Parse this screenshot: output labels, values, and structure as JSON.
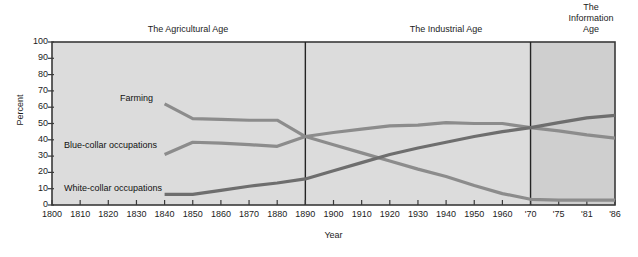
{
  "chart_data": {
    "type": "line",
    "title": "",
    "xlabel": "Year",
    "ylabel": "Percent",
    "ylim": [
      0,
      100
    ],
    "ytick_values": [
      0,
      10,
      20,
      30,
      40,
      50,
      60,
      70,
      80,
      90,
      100
    ],
    "xtick_labels": [
      "1800",
      "1810",
      "1820",
      "1830",
      "1840",
      "1850",
      "1860",
      "1870",
      "1880",
      "1890",
      "1900",
      "1910",
      "1920",
      "1930",
      "1940",
      "1950",
      "1960",
      "'70",
      "'75",
      "'81",
      "'86"
    ],
    "xtick_years": [
      1800,
      1810,
      1820,
      1830,
      1840,
      1850,
      1860,
      1870,
      1880,
      1890,
      1900,
      1910,
      1920,
      1930,
      1940,
      1950,
      1960,
      1970,
      1975,
      1981,
      1986
    ],
    "grid": false,
    "legend_position": "inline-annotations",
    "series": [
      {
        "name": "Farming",
        "color": "#8c8c8c",
        "x": [
          1840,
          1850,
          1860,
          1870,
          1880,
          1890,
          1900,
          1910,
          1920,
          1930,
          1940,
          1950,
          1960,
          1970,
          1975,
          1981,
          1986
        ],
        "values": [
          62,
          53,
          52.5,
          52,
          52,
          42,
          37,
          32,
          27,
          22,
          17.5,
          12,
          7,
          3.5,
          3,
          3,
          3
        ]
      },
      {
        "name": "Blue-collar occupations",
        "color": "#8c8c8c",
        "x": [
          1840,
          1850,
          1860,
          1870,
          1880,
          1890,
          1900,
          1910,
          1920,
          1930,
          1940,
          1950,
          1960,
          1970,
          1975,
          1981,
          1986
        ],
        "values": [
          31,
          38.5,
          38,
          37,
          36,
          42,
          44.5,
          46.5,
          48.5,
          49,
          50.5,
          50,
          50,
          47.5,
          45.5,
          43,
          41
        ]
      },
      {
        "name": "White-collar occupations",
        "color": "#6e6e6e",
        "x": [
          1840,
          1850,
          1860,
          1870,
          1880,
          1890,
          1900,
          1910,
          1920,
          1930,
          1940,
          1950,
          1960,
          1970,
          1975,
          1981,
          1986
        ],
        "values": [
          6.5,
          6.5,
          9,
          11.5,
          13.5,
          16,
          21,
          26,
          31,
          35,
          38.5,
          42,
          45,
          47.5,
          50.5,
          53.5,
          55
        ]
      }
    ],
    "eras": [
      {
        "id": "agricultural",
        "label": "The Agricultural Age",
        "start_year": 1800,
        "end_year": 1890,
        "shade": "#dcdcdc"
      },
      {
        "id": "industrial",
        "label": "The Industrial Age",
        "start_year": 1890,
        "end_year": 1970,
        "shade": "#dcdcdc"
      },
      {
        "id": "information",
        "label": "The\nInformation\nAge",
        "start_year": 1970,
        "end_year": 1990,
        "shade": "#cfcfcf"
      }
    ],
    "series_annotations": [
      {
        "text": "Farming",
        "x_px": 120,
        "y_px": 93
      },
      {
        "text": "Blue-collar occupations",
        "x_px": 64,
        "y_px": 140
      },
      {
        "text": "White-collar occupations",
        "x_px": 64,
        "y_px": 183
      }
    ],
    "colors": {
      "plot_background": "#dcdcdc",
      "information_age_background": "#cfcfcf",
      "axis": "#3a3a3a",
      "farming_line": "#8c8c8c",
      "blue_collar_line": "#8c8c8c",
      "white_collar_line": "#6e6e6e",
      "text": "#1c1c1c"
    }
  }
}
